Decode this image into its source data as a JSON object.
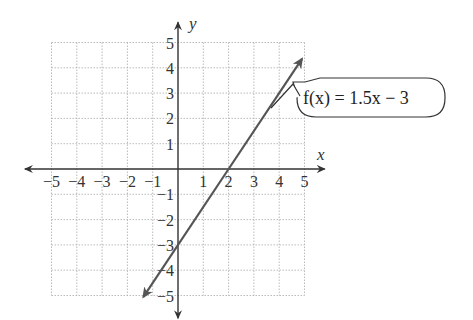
{
  "chart_data": {
    "type": "line",
    "title": "",
    "xlabel": "x",
    "ylabel": "y",
    "xlim": [
      -5,
      5
    ],
    "ylim": [
      -5,
      5
    ],
    "grid": true,
    "x_ticks": [
      "−5",
      "−4",
      "−3",
      "−2",
      "−1",
      "1",
      "2",
      "3",
      "4",
      "5"
    ],
    "y_ticks": [
      "5",
      "4",
      "3",
      "2",
      "1",
      "−1",
      "−2",
      "−3",
      "−4",
      "−5"
    ],
    "series": [
      {
        "name": "f(x) = 1.5x − 3",
        "slope": 1.5,
        "intercept": -3,
        "x": [
          -1.33,
          0,
          2,
          4.67
        ],
        "y": [
          -5,
          -3,
          0,
          4
        ]
      }
    ],
    "annotations": [
      {
        "text": "f(x) = 1.5x − 3",
        "points_to": [
          2.67,
          1
        ]
      }
    ]
  },
  "labels": {
    "x_axis": "x",
    "y_axis": "y",
    "equation": "f(x) = 1.5x − 3"
  }
}
